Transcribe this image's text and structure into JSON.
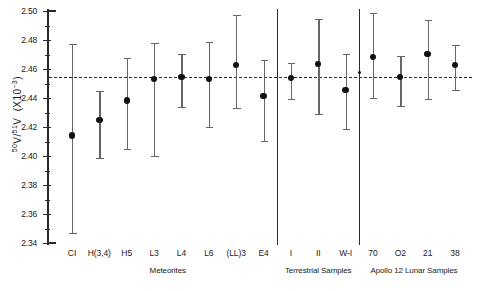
{
  "chart_data": {
    "type": "scatter",
    "title": "",
    "xlabel": "",
    "ylabel": "50V/51V  (X10-3)",
    "ylabel_parts": {
      "num": "50",
      "den": "51",
      "v": "V",
      "scale": "(×10",
      "exp": "-3",
      "close": ")"
    },
    "ylim": [
      2.34,
      2.5
    ],
    "ytick_step": 0.02,
    "yticks": [
      "2.50",
      "2.48",
      "2.46",
      "2.44",
      "2.42",
      "2.40",
      "2.38",
      "2.36",
      "2.34"
    ],
    "ytick_values": [
      2.5,
      2.48,
      2.46,
      2.44,
      2.42,
      2.4,
      2.38,
      2.36,
      2.34
    ],
    "grid": false,
    "legend": "none",
    "reference_line": {
      "value": 2.4545,
      "style": "dashed",
      "label": ""
    },
    "categories": [
      "CI",
      "H(3,4)",
      "H5",
      "L3",
      "L4",
      "L6",
      "(LL)3",
      "E4",
      "I",
      "II",
      "W-I",
      "70",
      "O2",
      "21",
      "38"
    ],
    "values": [
      2.4141,
      2.4248,
      2.4382,
      2.4531,
      2.4545,
      2.4531,
      2.4627,
      2.4413,
      2.4538,
      2.4634,
      2.4455,
      2.4682,
      2.4545,
      2.4703,
      2.4627
    ],
    "err_low": [
      2.347,
      2.3986,
      2.4048,
      2.4,
      2.4338,
      2.42,
      2.4331,
      2.4103,
      2.4393,
      2.429,
      2.4186,
      2.44,
      2.4345,
      2.4393,
      2.4455
    ],
    "err_high": [
      2.4772,
      2.4448,
      2.4676,
      2.4779,
      2.4703,
      2.4786,
      2.4972,
      2.4662,
      2.4641,
      2.4945,
      2.4703,
      2.4986,
      2.4689,
      2.4938,
      2.4765
    ],
    "group_dividers_after": [
      "E4",
      "W-I"
    ],
    "groups": [
      {
        "label": "Meteorites",
        "members": [
          "CI",
          "H(3,4)",
          "H5",
          "L3",
          "L4",
          "L6",
          "(LL)3",
          "E4"
        ]
      },
      {
        "label": "Terrestrial Samples",
        "members": [
          "I",
          "II",
          "W-I"
        ]
      },
      {
        "label": "Apollo 12 Lunar Samples",
        "members": [
          "70",
          "O2",
          "21",
          "38"
        ]
      }
    ],
    "extra_markers": [
      {
        "x_category": "W-I",
        "value": 2.4579,
        "size": "small",
        "note": "small point left of 70 series"
      }
    ],
    "colors": {
      "axis": "#2b2b2b",
      "marker": "#111111",
      "errorbar": "#666666",
      "refline": "#2b2b2b",
      "background": "#ffffff"
    }
  }
}
